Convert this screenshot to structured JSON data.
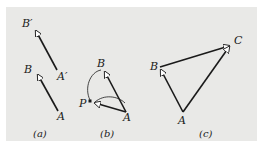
{
  "figure": {
    "background": "#e9e9e7",
    "line_color": "#1a1a1a",
    "arrowhead_fill": "#ffffff",
    "panels": [
      {
        "caption": "(a)",
        "labels": {
          "B_prime": "B′",
          "A_prime": "A′",
          "B": "B",
          "A": "A"
        },
        "vectors": [
          {
            "from": "A′",
            "to": "B′"
          },
          {
            "from": "A",
            "to": "B"
          }
        ]
      },
      {
        "caption": "(b)",
        "labels": {
          "B": "B",
          "P": "P",
          "A": "A"
        },
        "vectors": [
          {
            "from": "A",
            "to": "B"
          },
          {
            "from": "A",
            "to": "P"
          }
        ],
        "arcs": [
          "B to P (rotation about A)",
          "P to A"
        ]
      },
      {
        "caption": "(c)",
        "labels": {
          "A": "A",
          "B": "B",
          "C": "C"
        },
        "vectors": [
          {
            "from": "A",
            "to": "B"
          },
          {
            "from": "B",
            "to": "C"
          },
          {
            "from": "A",
            "to": "C"
          }
        ]
      }
    ]
  }
}
